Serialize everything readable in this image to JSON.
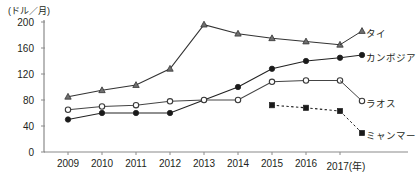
{
  "chart_data": {
    "type": "line",
    "title": "",
    "unit_label": "(ドル／月)",
    "xlabel": "(年)",
    "ylabel": "",
    "categories": [
      "2009",
      "2010",
      "2011",
      "2012",
      "2013",
      "2014",
      "2015",
      "2016",
      "2017"
    ],
    "x_tick_labels": [
      "2009",
      "2010",
      "2011",
      "2012",
      "2013",
      "2014",
      "2015",
      "2016",
      "2017(年)"
    ],
    "y_tick_labels": [
      "0",
      "40",
      "80",
      "120",
      "160",
      "200"
    ],
    "y_ticks": [
      0,
      40,
      80,
      120,
      160,
      200
    ],
    "ylim": [
      0,
      200
    ],
    "grid": false,
    "legend_position": "right-inline",
    "series": [
      {
        "name": "タイ",
        "marker": "triangle",
        "line_style": "solid",
        "color": "#333333",
        "values": [
          85,
          95,
          103,
          128,
          196,
          182,
          175,
          170,
          165
        ]
      },
      {
        "name": "カンボジア",
        "marker": "filled-circle",
        "line_style": "solid",
        "color": "#222222",
        "values": [
          50,
          60,
          60,
          60,
          80,
          100,
          128,
          140,
          145
        ]
      },
      {
        "name": "ラオス",
        "marker": "open-circle",
        "line_style": "solid",
        "color": "#444444",
        "values": [
          65,
          70,
          72,
          78,
          80,
          80,
          108,
          110,
          110
        ]
      },
      {
        "name": "ミャンマー",
        "marker": "filled-square",
        "line_style": "dashed",
        "color": "#222222",
        "values": [
          null,
          null,
          null,
          null,
          null,
          null,
          72,
          68,
          63
        ]
      }
    ]
  },
  "labels": {
    "unit": "(ドル／月)",
    "series": {
      "thailand": "タイ",
      "cambodia": "カンボジア",
      "laos": "ラオス",
      "myanmar": "ミャンマー"
    }
  }
}
